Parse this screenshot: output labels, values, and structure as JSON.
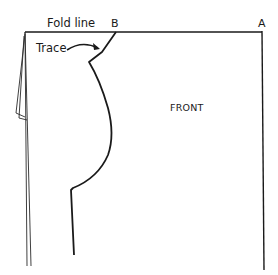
{
  "diagram": {
    "type": "sewing-pattern-piece",
    "labels": {
      "fold_line": "Fold line",
      "point_b": "B",
      "point_a": "A",
      "trace": "Trace",
      "piece_name": "FRONT"
    },
    "colors": {
      "line": "#1a1a1a",
      "background": "#ffffff"
    },
    "elements": [
      {
        "name": "fold-line",
        "description": "Top edge from left corner to point A"
      },
      {
        "name": "center-front-edge",
        "description": "Right vertical edge from A downward"
      },
      {
        "name": "neckline-armhole-curve",
        "description": "Traced curve from B down through armhole to side seam"
      },
      {
        "name": "trace-arrow",
        "description": "Curved arrow from 'Trace' label pointing to the neckline"
      },
      {
        "name": "left-layered-edges",
        "description": "Overlapping fabric edges on the left side"
      }
    ]
  }
}
